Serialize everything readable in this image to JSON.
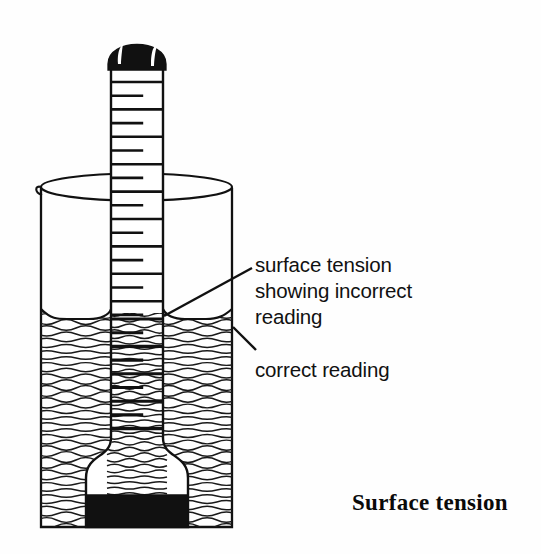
{
  "figure": {
    "caption": "Surface tension",
    "annotations": {
      "incorrect": {
        "line1": "surface tension",
        "line2": "showing incorrect",
        "line3": "reading"
      },
      "correct": {
        "line1": "correct reading"
      }
    },
    "apparatus": {
      "instrument_name": "hydrometer",
      "vessel_name": "beaker",
      "liquid_name": "water",
      "cap_name": "black-bulb-cap",
      "ballast_name": "black-ballast"
    },
    "colors": {
      "ink": "#111111",
      "fill_black": "#111111",
      "paper": "#fefefe",
      "highlight": "#ffffff"
    },
    "geometry": {
      "tube_left": 111,
      "tube_right": 163,
      "tube_top": 68,
      "beaker_left": 41,
      "beaker_right": 232,
      "beaker_rim_y": 187,
      "beaker_bottom_y": 527,
      "water_level_y": 318,
      "meniscus_top_y": 313,
      "ballast_top_y": 495
    },
    "scale": {
      "tick_count": 18,
      "first_tick_y": 82,
      "tick_spacing": 13.7,
      "long_tick_fraction": 1.0,
      "short_tick_fraction": 0.62
    }
  }
}
